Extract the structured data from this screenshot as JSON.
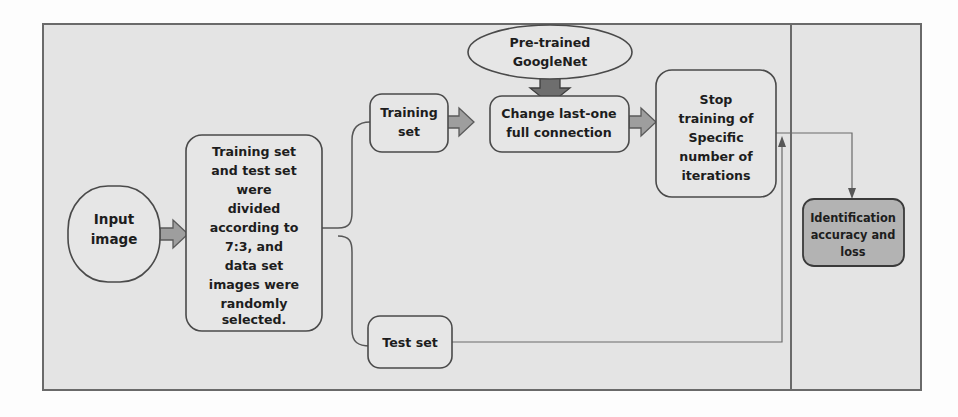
{
  "figure": {
    "kind": "flowchart",
    "background_color": "#fdfdfd",
    "panel_fill": "#e4e4e4",
    "panel_border_color": "#6a6a6a",
    "node_fill": "#e6e6e6",
    "node_highlight_fill": "#b3b3b3",
    "arrow_fill": "#9e9e9e",
    "arrow_strong_fill": "#6e6e6e",
    "connector_color": "#575757"
  },
  "nodes": {
    "input_image": {
      "label_lines": [
        "Input",
        "image"
      ],
      "shape": "rounded-capsule"
    },
    "split_description": {
      "label_lines": [
        "Training set",
        "and test set",
        "were",
        "divided",
        "according to",
        "7:3, and",
        "data set",
        "images were",
        "randomly",
        "selected."
      ],
      "shape": "rounded-rect"
    },
    "training_set": {
      "label_lines": [
        "Training",
        "set"
      ],
      "shape": "rounded-rect"
    },
    "test_set": {
      "label_lines": [
        "Test set"
      ],
      "shape": "rounded-rect"
    },
    "pretrained_googlenet": {
      "label_lines": [
        "Pre-trained",
        "GoogleNet"
      ],
      "shape": "ellipse"
    },
    "change_full_connection": {
      "label_lines": [
        "Change last-one",
        "full connection"
      ],
      "shape": "rounded-rect"
    },
    "stop_training": {
      "label_lines": [
        "Stop",
        "training of",
        "Specific",
        "number of",
        "iterations"
      ],
      "shape": "rounded-rect"
    },
    "identification_result": {
      "label_lines": [
        "Identification",
        "accuracy and",
        "loss"
      ],
      "shape": "rounded-rect",
      "highlighted": true
    }
  },
  "edges": [
    {
      "name": "input-to-split",
      "from": "input_image",
      "to": "split_description",
      "style": "block-arrow"
    },
    {
      "name": "split-to-training-set",
      "from": "split_description",
      "to": "training_set",
      "style": "curved-fork"
    },
    {
      "name": "split-to-test-set",
      "from": "split_description",
      "to": "test_set",
      "style": "curved-fork"
    },
    {
      "name": "training-set-to-change",
      "from": "training_set",
      "to": "change_full_connection",
      "style": "block-arrow"
    },
    {
      "name": "googlenet-to-change",
      "from": "pretrained_googlenet",
      "to": "change_full_connection",
      "style": "block-arrow-down"
    },
    {
      "name": "change-to-stop",
      "from": "change_full_connection",
      "to": "stop_training",
      "style": "block-arrow"
    },
    {
      "name": "stop-to-identification",
      "from": "stop_training",
      "to": "identification_result",
      "style": "line-arrow"
    },
    {
      "name": "test-set-to-stop",
      "from": "test_set",
      "to": "stop_training",
      "style": "line-arrow-up"
    }
  ]
}
